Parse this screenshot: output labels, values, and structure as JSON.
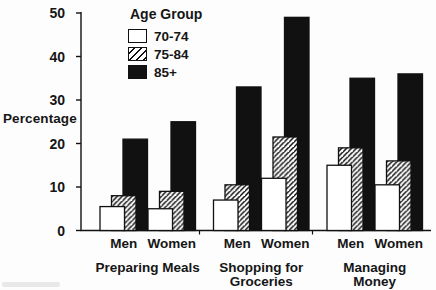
{
  "chart_data": {
    "type": "bar",
    "style": "overlapping-grouped-bars",
    "title": "",
    "legend_title": "Age Group",
    "legend_position": "top-left-inside",
    "ylabel": "Percentage",
    "xlabel": "",
    "ylim": [
      0,
      50
    ],
    "yticks": [
      0,
      10,
      20,
      30,
      40,
      50
    ],
    "grid": false,
    "series": [
      {
        "name": "70-74",
        "fill": "white"
      },
      {
        "name": "75-84",
        "fill": "hatch"
      },
      {
        "name": "85+",
        "fill": "black"
      }
    ],
    "groups": [
      {
        "label_lines": [
          "Preparing Meals"
        ],
        "subgroups": [
          {
            "label": "Men",
            "values": [
              5.5,
              8,
              21
            ]
          },
          {
            "label": "Women",
            "values": [
              5,
              9,
              25
            ]
          }
        ]
      },
      {
        "label_lines": [
          "Shopping for",
          "Groceries"
        ],
        "subgroups": [
          {
            "label": "Men",
            "values": [
              7,
              10.5,
              33
            ]
          },
          {
            "label": "Women",
            "values": [
              12,
              21.5,
              49
            ]
          }
        ]
      },
      {
        "label_lines": [
          "Managing",
          "Money"
        ],
        "subgroups": [
          {
            "label": "Men",
            "values": [
              15,
              19,
              35
            ]
          },
          {
            "label": "Women",
            "values": [
              10.5,
              16,
              36
            ]
          }
        ]
      }
    ],
    "colors": {
      "bar_black": "#111111",
      "bar_white": "#ffffff",
      "stroke": "#111111",
      "text": "#161616",
      "background": "#fdfdfd"
    }
  }
}
